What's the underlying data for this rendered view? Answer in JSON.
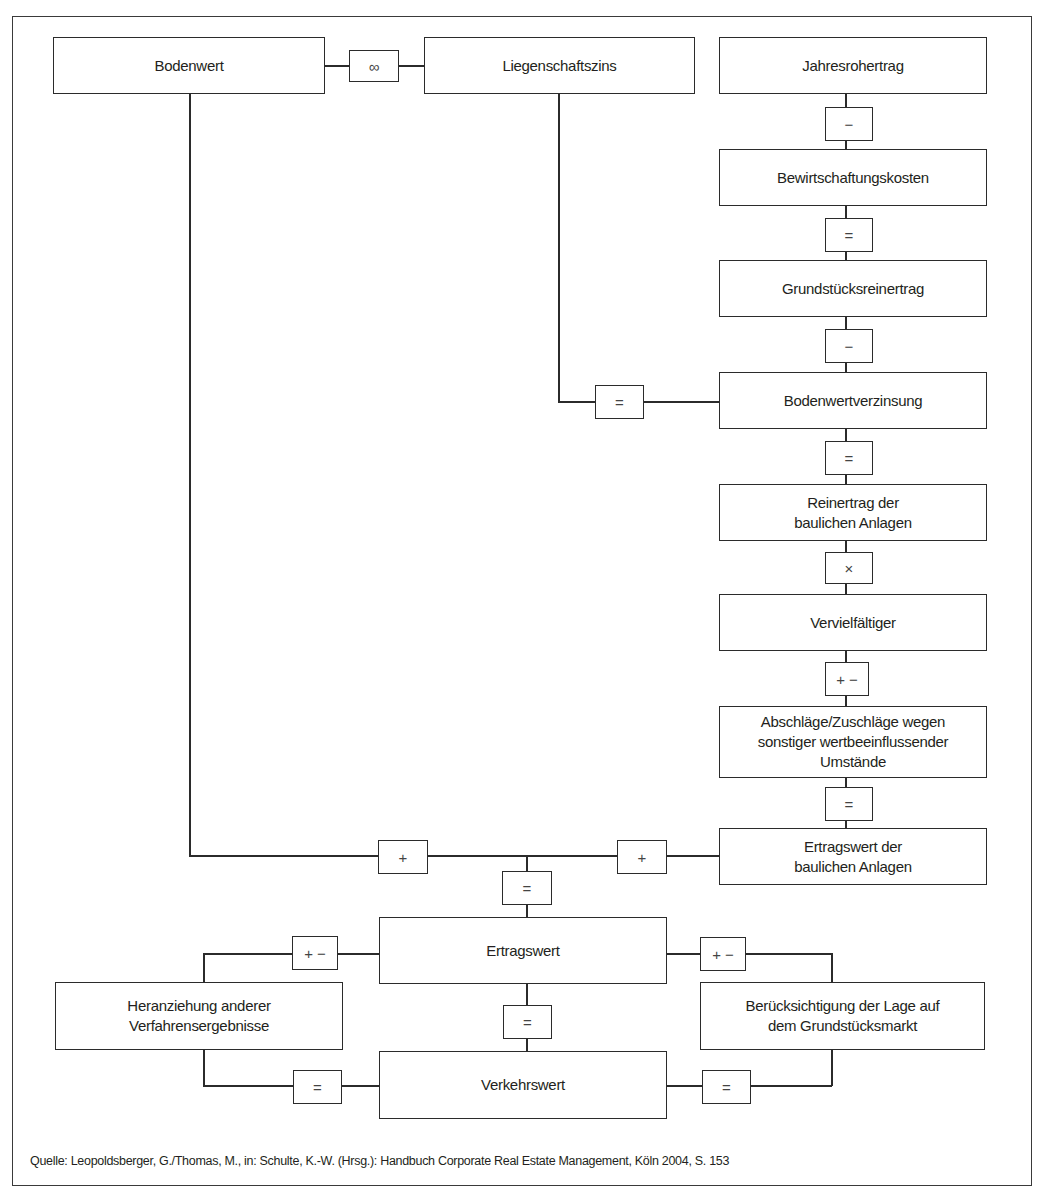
{
  "diagram": {
    "nodes": {
      "bodenwert": "Bodenwert",
      "liegenschaftszins": "Liegenschaftszins",
      "jahresrohertrag": "Jahresrohertrag",
      "bewirtschaftungskosten": "Bewirtschaftungskosten",
      "grundstuecksreinertrag": "Grundstücksreinertrag",
      "bodenwertverzinsung": "Bodenwertverzinsung",
      "reinertrag_bauliche_anlagen": "Reinertrag der\nbaulichen Anlagen",
      "vervielfaeltiger": "Vervielfältiger",
      "abschlaege_zuschlaege": "Abschläge/Zuschläge wegen\nsonstiger wertbeeinflussender\nUmstände",
      "ertragswert_bauliche_anlagen": "Ertragswert der\nbaulichen Anlagen",
      "ertragswert": "Ertragswert",
      "heranziehung": "Heranziehung anderer\nVerfahrensergebnisse",
      "beruecksichtigung": "Berücksichtigung der Lage auf\ndem Grundstücksmarkt",
      "verkehrswert": "Verkehrswert"
    },
    "operators": {
      "infinity": "∞",
      "minus1": "−",
      "equals1": "=",
      "minus2": "−",
      "equals_left": "=",
      "equals2": "=",
      "times": "×",
      "plusminus1": "+ −",
      "equals3": "=",
      "plus_left": "+",
      "plus_right": "+",
      "equals_center": "=",
      "plusminus_left": "+ −",
      "plusminus_right": "+ −",
      "equals_ertrag_verkehr": "=",
      "equals_bottom_left": "=",
      "equals_bottom_right": "="
    },
    "edges": [
      [
        "Bodenwert",
        "∞",
        "Liegenschaftszins"
      ],
      [
        "Jahresrohertrag",
        "−",
        "Bewirtschaftungskosten"
      ],
      [
        "Bewirtschaftungskosten",
        "=",
        "Grundstücksreinertrag"
      ],
      [
        "Grundstücksreinertrag",
        "−",
        "Bodenwertverzinsung"
      ],
      [
        "Liegenschaftszins",
        "=",
        "Bodenwertverzinsung"
      ],
      [
        "Bodenwertverzinsung",
        "=",
        "Reinertrag der baulichen Anlagen"
      ],
      [
        "Reinertrag der baulichen Anlagen",
        "×",
        "Vervielfältiger"
      ],
      [
        "Vervielfältiger",
        "+ −",
        "Abschläge/Zuschläge wegen sonstiger wertbeeinflussender Umstände"
      ],
      [
        "Abschläge/Zuschläge wegen sonstiger wertbeeinflussender Umstände",
        "=",
        "Ertragswert der baulichen Anlagen"
      ],
      [
        "Bodenwert",
        "+",
        "Ertragswert"
      ],
      [
        "Ertragswert der baulichen Anlagen",
        "+",
        "Ertragswert"
      ],
      [
        "Ertragswert",
        "+ −",
        "Heranziehung anderer Verfahrensergebnisse"
      ],
      [
        "Ertragswert",
        "+ −",
        "Berücksichtigung der Lage auf dem Grundstücksmarkt"
      ],
      [
        "Ertragswert",
        "=",
        "Verkehrswert"
      ],
      [
        "Heranziehung anderer Verfahrensergebnisse",
        "=",
        "Verkehrswert"
      ],
      [
        "Berücksichtigung der Lage auf dem Grundstücksmarkt",
        "=",
        "Verkehrswert"
      ]
    ],
    "source": "Quelle: Leopoldsberger, G./Thomas, M., in: Schulte, K.-W. (Hrsg.): Handbuch Corporate Real Estate Management, Köln 2004, S. 153"
  }
}
